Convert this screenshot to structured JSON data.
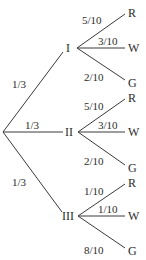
{
  "diagram": {
    "type": "probability-tree",
    "root": {
      "x": 3,
      "y": 132
    },
    "level1": [
      {
        "id": "I",
        "label": "I",
        "prob": "1/3",
        "node": {
          "x": 77,
          "y": 48
        },
        "text": {
          "x": 66,
          "y": 52
        },
        "prob_pos": {
          "x": 12,
          "y": 88
        },
        "edge_end": {
          "x": 63,
          "y": 52
        },
        "children": [
          {
            "label": "R",
            "prob": "5/10",
            "end": {
              "x": 125,
              "y": 14
            },
            "text": {
              "x": 128,
              "y": 17
            },
            "prob_pos": {
              "x": 82,
              "y": 24
            }
          },
          {
            "label": "W",
            "prob": "3/10",
            "end": {
              "x": 125,
              "y": 48
            },
            "text": {
              "x": 128,
              "y": 52
            },
            "prob_pos": {
              "x": 98,
              "y": 45
            }
          },
          {
            "label": "G",
            "prob": "2/10",
            "end": {
              "x": 125,
              "y": 80
            },
            "text": {
              "x": 128,
              "y": 87
            },
            "prob_pos": {
              "x": 84,
              "y": 81
            }
          }
        ]
      },
      {
        "id": "II",
        "label": "II",
        "prob": "1/3",
        "node": {
          "x": 78,
          "y": 132
        },
        "text": {
          "x": 65,
          "y": 136
        },
        "prob_pos": {
          "x": 25,
          "y": 129
        },
        "edge_end": {
          "x": 63,
          "y": 132
        },
        "children": [
          {
            "label": "R",
            "prob": "5/10",
            "end": {
              "x": 125,
              "y": 99
            },
            "text": {
              "x": 128,
              "y": 102
            },
            "prob_pos": {
              "x": 84,
              "y": 110
            }
          },
          {
            "label": "W",
            "prob": "3/10",
            "end": {
              "x": 125,
              "y": 132
            },
            "text": {
              "x": 128,
              "y": 136
            },
            "prob_pos": {
              "x": 98,
              "y": 129
            }
          },
          {
            "label": "G",
            "prob": "2/10",
            "end": {
              "x": 125,
              "y": 165
            },
            "text": {
              "x": 128,
              "y": 172
            },
            "prob_pos": {
              "x": 84,
              "y": 165
            }
          }
        ]
      },
      {
        "id": "III",
        "label": "III",
        "prob": "1/3",
        "node": {
          "x": 78,
          "y": 216
        },
        "text": {
          "x": 62,
          "y": 220
        },
        "prob_pos": {
          "x": 12,
          "y": 186
        },
        "edge_end": {
          "x": 62,
          "y": 212
        },
        "children": [
          {
            "label": "R",
            "prob": "1/10",
            "end": {
              "x": 125,
              "y": 184
            },
            "text": {
              "x": 128,
              "y": 187
            },
            "prob_pos": {
              "x": 84,
              "y": 195
            }
          },
          {
            "label": "W",
            "prob": "1/10",
            "end": {
              "x": 125,
              "y": 216
            },
            "text": {
              "x": 128,
              "y": 220
            },
            "prob_pos": {
              "x": 98,
              "y": 213
            }
          },
          {
            "label": "G",
            "prob": "8/10",
            "end": {
              "x": 125,
              "y": 248
            },
            "text": {
              "x": 128,
              "y": 255
            },
            "prob_pos": {
              "x": 84,
              "y": 254
            }
          }
        ]
      }
    ],
    "colors": {
      "line": "#3a3a3a",
      "text": "#2b2b2b",
      "background": "#ffffff"
    }
  }
}
